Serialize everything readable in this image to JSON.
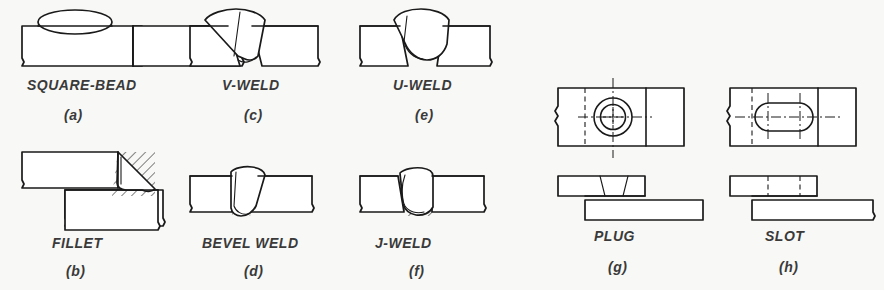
{
  "figure": {
    "background_color": "#f8f8f6",
    "line_color": "#1a1a1a",
    "fill_color": "#ffffff",
    "text_color": "#3a3a3a"
  },
  "items": [
    {
      "key": "square-bead",
      "name": "SQUARE-BEAD",
      "letter": "(a)",
      "joint": "butt joint, square groove with raised bead",
      "column": 1,
      "row": 1
    },
    {
      "key": "fillet",
      "name": "FILLET",
      "letter": "(b)",
      "joint": "lap joint with triangular fillet weld",
      "column": 1,
      "row": 2
    },
    {
      "key": "v-weld",
      "name": "V-WELD",
      "letter": "(c)",
      "joint": "butt joint, V groove",
      "column": 2,
      "row": 1
    },
    {
      "key": "bevel-weld",
      "name": "BEVEL WELD",
      "letter": "(d)",
      "joint": "butt joint, single bevel groove",
      "column": 2,
      "row": 2
    },
    {
      "key": "u-weld",
      "name": "U-WELD",
      "letter": "(e)",
      "joint": "butt joint, U groove",
      "column": 3,
      "row": 1
    },
    {
      "key": "j-weld",
      "name": "J-WELD",
      "letter": "(f)",
      "joint": "butt joint, single J groove",
      "column": 3,
      "row": 2
    },
    {
      "key": "plug",
      "name": "PLUG",
      "letter": "(g)",
      "joint": "lap joint with circular plug weld, top and side views",
      "column": 4,
      "row": 0
    },
    {
      "key": "slot",
      "name": "SLOT",
      "letter": "(h)",
      "joint": "lap joint with elongated slot weld, top and side views",
      "column": 5,
      "row": 0
    }
  ],
  "labels": {
    "square_bead_name": "SQUARE-BEAD",
    "square_bead_letter": "(a)",
    "fillet_name": "FILLET",
    "fillet_letter": "(b)",
    "v_weld_name": "V-WELD",
    "v_weld_letter": "(c)",
    "bevel_weld_name": "BEVEL WELD",
    "bevel_weld_letter": "(d)",
    "u_weld_name": "U-WELD",
    "u_weld_letter": "(e)",
    "j_weld_name": "J-WELD",
    "j_weld_letter": "(f)",
    "plug_name": "PLUG",
    "plug_letter": "(g)",
    "slot_name": "SLOT",
    "slot_letter": "(h)"
  }
}
